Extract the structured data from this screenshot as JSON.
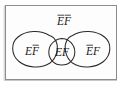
{
  "figure": {
    "type": "venn-diagram",
    "background_color": "#ffffff",
    "ink_color": "#1a1a1a",
    "curve_color": "#2b2b2b",
    "border_color": "#8c8c8c"
  },
  "sample_space": {
    "name": "sample-space-rectangle",
    "x": 5,
    "y": 5,
    "width": 112,
    "height": 75
  },
  "regions": [
    {
      "id": "e-not-f",
      "role": "left-oval-only",
      "label_base": "EF",
      "label_plain": "EF",
      "overline": "second-letter",
      "overline_letters": "F",
      "description": "E occurs and F does not occur",
      "label_x": 32,
      "label_y": 52
    },
    {
      "id": "e-and-f",
      "role": "intersection-lens",
      "label_base": "EF",
      "label_plain": "EF",
      "overline": "none",
      "overline_letters": "",
      "description": "Both E and F occur",
      "label_x": 63,
      "label_y": 53
    },
    {
      "id": "not-e-f",
      "role": "right-oval-only",
      "label_base": "EF",
      "label_plain": "EF",
      "overline": "first-letter",
      "overline_letters": "E",
      "description": "F occurs and E does not occur",
      "label_x": 94,
      "label_y": 52
    },
    {
      "id": "not-e-not-f",
      "role": "outside-both-ovals",
      "label_base": "EF",
      "label_plain": "EF",
      "overline": "both-letters",
      "overline_letters": "EF",
      "description": "Neither E nor F occurs",
      "label_x": 64,
      "label_y": 25
    }
  ],
  "labels": {
    "left": "EF",
    "center": "EF",
    "right": "EF",
    "top": "EF"
  },
  "letters": {
    "e": "E",
    "f": "F"
  },
  "typography": {
    "label_font_size": "11.5"
  }
}
